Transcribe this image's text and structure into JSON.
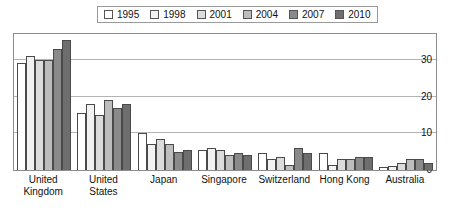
{
  "chart_data": {
    "type": "bar",
    "title": "",
    "xlabel": "",
    "ylabel": "",
    "ylim": [
      0,
      37
    ],
    "yticks": [
      0,
      10,
      20,
      30
    ],
    "grid": true,
    "legend_position": "top",
    "categories": [
      "United Kingdom",
      "United States",
      "Japan",
      "Singapore",
      "Switzerland",
      "Hong Kong",
      "Australia"
    ],
    "series": [
      {
        "name": "1995",
        "color": "#ffffff",
        "values": [
          29,
          15.5,
          10,
          5.5,
          4.5,
          4.5,
          0.8
        ]
      },
      {
        "name": "1998",
        "color": "#f2f2f2",
        "values": [
          31,
          18,
          7,
          6,
          3,
          1.5,
          1
        ]
      },
      {
        "name": "2001",
        "color": "#dcdcdc",
        "values": [
          30,
          15,
          8.5,
          5.5,
          3.5,
          3,
          2
        ]
      },
      {
        "name": "2004",
        "color": "#bdbdbd",
        "values": [
          30,
          19,
          7,
          4,
          1.5,
          3,
          3
        ]
      },
      {
        "name": "2007",
        "color": "#8a8a8a",
        "values": [
          33,
          17,
          5,
          4.5,
          6,
          3.5,
          3
        ]
      },
      {
        "name": "2010",
        "color": "#6e6e6e",
        "values": [
          35.5,
          18,
          5.5,
          4,
          4.5,
          3.5,
          2
        ]
      }
    ]
  },
  "legend": {
    "items": [
      {
        "label": "1995"
      },
      {
        "label": "1998"
      },
      {
        "label": "2001"
      },
      {
        "label": "2004"
      },
      {
        "label": "2007"
      },
      {
        "label": "2010"
      }
    ]
  },
  "axis": {
    "ytick_labels": [
      "0",
      "10",
      "20",
      "30"
    ]
  },
  "category_labels": [
    "United\nKingdom",
    "United\nStates",
    "Japan",
    "Singapore",
    "Switzerland",
    "Hong Kong",
    "Australia"
  ]
}
